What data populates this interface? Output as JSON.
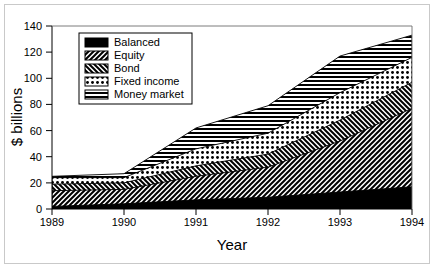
{
  "chart_data": {
    "type": "area",
    "stacked": true,
    "title": "",
    "xlabel": "Year",
    "ylabel": "$ billions",
    "x": [
      1989,
      1990,
      1991,
      1992,
      1993,
      1994
    ],
    "xticklabels": [
      "1989",
      "1990",
      "1991",
      "1992",
      "1993",
      "1994"
    ],
    "yticks": [
      0,
      20,
      40,
      60,
      80,
      100,
      120,
      140
    ],
    "yticklabels": [
      "0",
      "20",
      "40",
      "60",
      "80",
      "100",
      "120",
      "140"
    ],
    "xlim": [
      1989,
      1994
    ],
    "ylim": [
      0,
      140
    ],
    "grid": false,
    "legend_position": "upper left",
    "series": [
      {
        "name": "Balanced",
        "pattern": "solid-black",
        "values": [
          2,
          4,
          7,
          9,
          13,
          17
        ],
        "cumulative": [
          2,
          4,
          7,
          9,
          13,
          17
        ]
      },
      {
        "name": "Equity",
        "pattern": "diagonal-forward",
        "values": [
          12,
          11,
          18,
          23,
          39,
          60
        ],
        "cumulative": [
          14,
          15,
          25,
          32,
          52,
          77
        ]
      },
      {
        "name": "Bond",
        "pattern": "diagonal-back",
        "values": [
          5,
          5,
          8,
          10,
          16,
          20
        ],
        "cumulative": [
          19,
          20,
          33,
          42,
          68,
          97
        ]
      },
      {
        "name": "Fixed income",
        "pattern": "dots",
        "values": [
          5,
          4,
          13,
          16,
          21,
          19
        ],
        "cumulative": [
          24,
          24,
          46,
          58,
          89,
          116
        ]
      },
      {
        "name": "Money market",
        "pattern": "horizontal-lines",
        "values": [
          1,
          3,
          16,
          21,
          28,
          17
        ],
        "cumulative": [
          25,
          27,
          62,
          79,
          117,
          133
        ]
      }
    ],
    "totals": [
      25,
      27,
      62,
      79,
      117,
      133
    ]
  },
  "legend": {
    "items": [
      {
        "label": "Balanced"
      },
      {
        "label": "Equity"
      },
      {
        "label": "Bond"
      },
      {
        "label": "Fixed income"
      },
      {
        "label": "Money market"
      }
    ]
  },
  "axes": {
    "y_title": "$ billions",
    "x_title": "Year"
  },
  "colors": {
    "ink": "#000000",
    "background": "#ffffff",
    "frame": "#c9c9c9"
  }
}
